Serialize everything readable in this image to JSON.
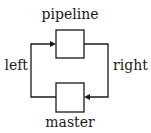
{
  "diagram": {
    "type": "flow-loop",
    "nodes": [
      {
        "id": "pipeline",
        "label": "pipeline",
        "position": "top"
      },
      {
        "id": "master",
        "label": "master",
        "position": "bottom"
      }
    ],
    "edges": [
      {
        "from": "pipeline",
        "to": "master",
        "label": "right",
        "side": "right"
      },
      {
        "from": "master",
        "to": "pipeline",
        "label": "left",
        "side": "left"
      }
    ],
    "colors": {
      "stroke": "#1a1a1a",
      "background": "#ffffff"
    }
  }
}
